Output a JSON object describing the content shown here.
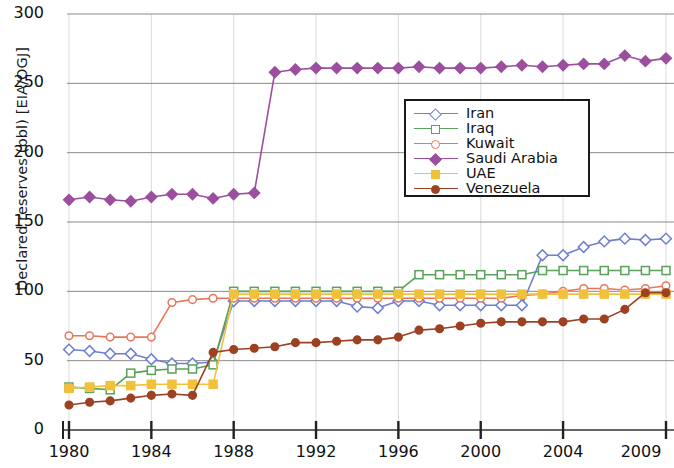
{
  "chart_data": {
    "type": "line",
    "title": "",
    "xlabel": "",
    "ylabel": "Declared reserves (bbl) [EIA/OGJ]",
    "xlim": [
      1980,
      2009
    ],
    "ylim": [
      0,
      300
    ],
    "grid": true,
    "legend_position": "upper center",
    "xticks": [
      1980,
      1984,
      1988,
      1992,
      1996,
      2000,
      2004,
      2009
    ],
    "xticklabels": [
      "1980",
      "1984",
      "1988",
      "1992",
      "1996",
      "2000",
      "2004",
      "2009"
    ],
    "yticks": [
      0,
      50,
      100,
      150,
      200,
      250,
      300
    ],
    "yticklabels": [
      "0",
      "50",
      "100",
      "150",
      "200",
      "250",
      "300"
    ],
    "x": [
      1980,
      1981,
      1982,
      1983,
      1984,
      1985,
      1986,
      1987,
      1988,
      1989,
      1990,
      1991,
      1992,
      1993,
      1994,
      1995,
      1996,
      1997,
      1998,
      1999,
      2000,
      2001,
      2002,
      2003,
      2004,
      2005,
      2006,
      2007,
      2008,
      2009
    ],
    "series": [
      {
        "name": "Iran",
        "color": "#6e7fd2",
        "marker": "open-diamond",
        "values": [
          58,
          57,
          55,
          55,
          51,
          48,
          48,
          49,
          93,
          93,
          93,
          93,
          93,
          93,
          89,
          88,
          93,
          93,
          90,
          90,
          90,
          90,
          90,
          126,
          126,
          132,
          136,
          138,
          137,
          138
        ]
      },
      {
        "name": "Iraq",
        "color": "#5aa15a",
        "marker": "open-square",
        "values": [
          31,
          30,
          29,
          41,
          43,
          44,
          44,
          47,
          100,
          100,
          100,
          100,
          100,
          100,
          100,
          100,
          100,
          112,
          112,
          112,
          112,
          112,
          112,
          115,
          115,
          115,
          115,
          115,
          115,
          115
        ]
      },
      {
        "name": "Kuwait",
        "color": "#e8765a",
        "marker": "open-circle",
        "values": [
          68,
          68,
          67,
          67,
          67,
          92,
          94,
          95,
          95,
          95,
          95,
          95,
          95,
          95,
          95,
          95,
          95,
          95,
          95,
          95,
          95,
          95,
          97,
          98,
          100,
          102,
          102,
          101,
          102,
          104
        ]
      },
      {
        "name": "Saudi Arabia",
        "color": "#9b4f9e",
        "marker": "filled-diamond",
        "values": [
          166,
          168,
          166,
          165,
          168,
          170,
          170,
          167,
          170,
          171,
          258,
          260,
          261,
          261,
          261,
          261,
          261,
          262,
          261,
          261,
          261,
          262,
          263,
          262,
          263,
          264,
          264,
          270,
          266,
          268
        ]
      },
      {
        "name": "UAE",
        "color": "#f2c13c",
        "marker": "filled-square",
        "values": [
          30,
          31,
          32,
          32,
          33,
          33,
          33,
          33,
          98,
          98,
          98,
          98,
          98,
          98,
          98,
          98,
          98,
          98,
          98,
          98,
          98,
          98,
          98,
          98,
          98,
          98,
          98,
          98,
          98,
          98
        ]
      },
      {
        "name": "Venezuela",
        "color": "#9c4223",
        "marker": "filled-circle",
        "values": [
          18,
          20,
          21,
          23,
          25,
          26,
          25,
          56,
          58,
          59,
          60,
          63,
          63,
          64,
          65,
          65,
          67,
          72,
          73,
          75,
          77,
          78,
          78,
          78,
          78,
          80,
          80,
          87,
          99,
          99
        ]
      }
    ]
  },
  "axes": {
    "ylabel_text": "Declared reserves (bbl) [EIA/OGJ]"
  },
  "legend": {
    "entries": [
      {
        "label": "Iran"
      },
      {
        "label": "Iraq"
      },
      {
        "label": "Kuwait"
      },
      {
        "label": "Saudi Arabia"
      },
      {
        "label": "UAE"
      },
      {
        "label": "Venezuela"
      }
    ]
  }
}
